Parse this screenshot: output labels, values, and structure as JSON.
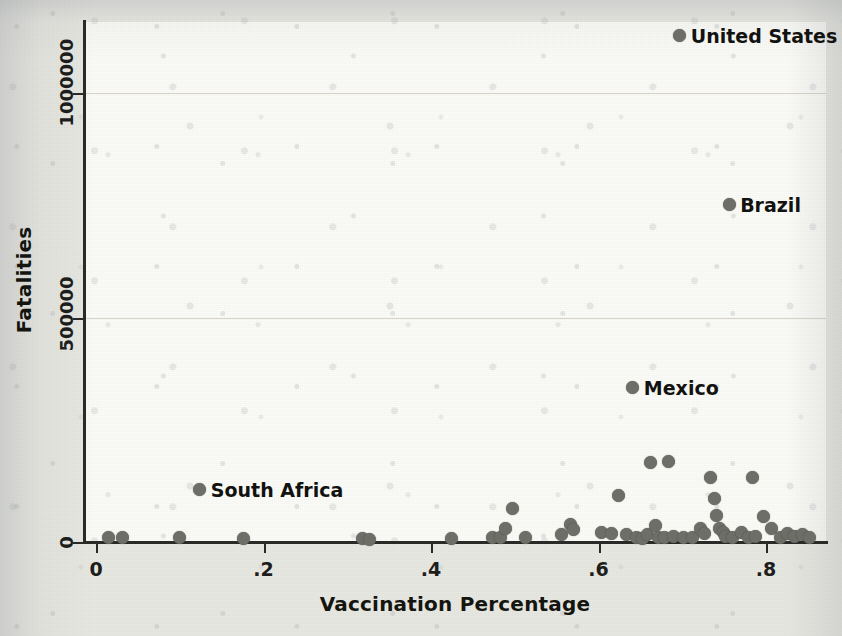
{
  "chart_data": {
    "type": "scatter",
    "title": "",
    "xlabel": "Vaccination Percentage",
    "ylabel": "Fatalities",
    "xlim": [
      -0.035,
      0.87
    ],
    "ylim": [
      -40000,
      1210000
    ],
    "xticks": [
      0,
      0.2,
      0.4,
      0.6,
      0.8
    ],
    "xticklabels": [
      "0",
      ".2",
      ".4",
      ".6",
      ".8"
    ],
    "yticks": [
      0,
      500000,
      1000000
    ],
    "yticklabels": [
      "0",
      "500000",
      "1000000"
    ],
    "grid": "horizontal",
    "legend": "none",
    "marker_color": "#6e6e68",
    "background_color": "#fbfbf7",
    "page_color": "#e8e8e2",
    "annotations": [
      {
        "label": "United States",
        "x": 0.697,
        "y": 1127000
      },
      {
        "label": "Brazil",
        "x": 0.756,
        "y": 751000
      },
      {
        "label": "Mexico",
        "x": 0.641,
        "y": 343000
      },
      {
        "label": "South Africa",
        "x": 0.124,
        "y": 116000
      }
    ],
    "points": [
      {
        "x": 0.015,
        "y": 9000
      },
      {
        "x": 0.032,
        "y": 9000
      },
      {
        "x": 0.1,
        "y": 9000
      },
      {
        "x": 0.176,
        "y": 7000
      },
      {
        "x": 0.124,
        "y": 116000
      },
      {
        "x": 0.318,
        "y": 7000
      },
      {
        "x": 0.327,
        "y": 5000
      },
      {
        "x": 0.424,
        "y": 7000
      },
      {
        "x": 0.474,
        "y": 11000
      },
      {
        "x": 0.483,
        "y": 9000
      },
      {
        "x": 0.489,
        "y": 29000
      },
      {
        "x": 0.497,
        "y": 74000
      },
      {
        "x": 0.513,
        "y": 11000
      },
      {
        "x": 0.556,
        "y": 16000
      },
      {
        "x": 0.566,
        "y": 38000
      },
      {
        "x": 0.57,
        "y": 27000
      },
      {
        "x": 0.604,
        "y": 22000
      },
      {
        "x": 0.615,
        "y": 20000
      },
      {
        "x": 0.624,
        "y": 103000
      },
      {
        "x": 0.633,
        "y": 16000
      },
      {
        "x": 0.641,
        "y": 343000
      },
      {
        "x": 0.645,
        "y": 9000
      },
      {
        "x": 0.652,
        "y": 7000
      },
      {
        "x": 0.658,
        "y": 16000
      },
      {
        "x": 0.662,
        "y": 178000
      },
      {
        "x": 0.668,
        "y": 36000
      },
      {
        "x": 0.672,
        "y": 11000
      },
      {
        "x": 0.679,
        "y": 9000
      },
      {
        "x": 0.684,
        "y": 180000
      },
      {
        "x": 0.69,
        "y": 13000
      },
      {
        "x": 0.697,
        "y": 1127000
      },
      {
        "x": 0.701,
        "y": 9000
      },
      {
        "x": 0.712,
        "y": 11000
      },
      {
        "x": 0.722,
        "y": 31000
      },
      {
        "x": 0.726,
        "y": 18000
      },
      {
        "x": 0.734,
        "y": 143000
      },
      {
        "x": 0.738,
        "y": 96000
      },
      {
        "x": 0.741,
        "y": 60000
      },
      {
        "x": 0.745,
        "y": 31000
      },
      {
        "x": 0.749,
        "y": 22000
      },
      {
        "x": 0.752,
        "y": 13000
      },
      {
        "x": 0.756,
        "y": 751000
      },
      {
        "x": 0.76,
        "y": 11000
      },
      {
        "x": 0.771,
        "y": 22000
      },
      {
        "x": 0.779,
        "y": 9000
      },
      {
        "x": 0.784,
        "y": 143000
      },
      {
        "x": 0.788,
        "y": 13000
      },
      {
        "x": 0.797,
        "y": 56000
      },
      {
        "x": 0.806,
        "y": 31000
      },
      {
        "x": 0.817,
        "y": 9000
      },
      {
        "x": 0.826,
        "y": 20000
      },
      {
        "x": 0.834,
        "y": 13000
      },
      {
        "x": 0.843,
        "y": 16000
      },
      {
        "x": 0.852,
        "y": 11000
      }
    ]
  }
}
